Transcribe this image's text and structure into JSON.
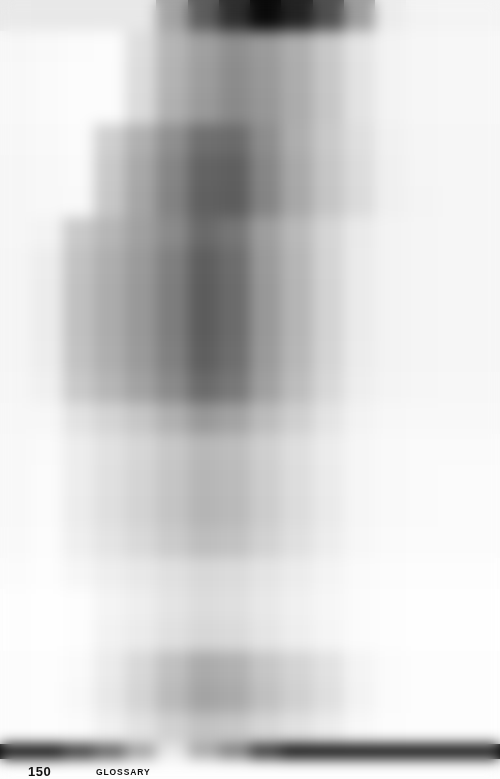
{
  "page": {
    "width": 500,
    "height": 779,
    "background": "#fdfdfd",
    "kind": "pixelated-book-page"
  },
  "footer": {
    "folio": "150",
    "running_head": "GLOSSARY"
  },
  "mosaic": {
    "columns": 16,
    "description": "Heavily pixelated grayscale mosaic of a scanned book page; a dark column of text runs down the centre with wide light margins left and right.",
    "row_heights": [
      31,
      31,
      31,
      31,
      31,
      31,
      31,
      31,
      31,
      31,
      31,
      31,
      31,
      31,
      31,
      31,
      31,
      31,
      31,
      31,
      31,
      31,
      31,
      31,
      15
    ],
    "palette": {
      "paper": "#fdfdfd",
      "ink": "#000000",
      "accent_dark": "#5a5a5a",
      "accent_mid": "#9a9a9a",
      "accent_light": "#e6e6e6"
    },
    "rows": [
      [
        "#e9e9e9",
        "#e8e8e8",
        "#e8e8e8",
        "#e8e8e8",
        "#e8e8e8",
        "#a3a3a3",
        "#5c5c5c",
        "#2e2e2e",
        "#0a0a0a",
        "#232323",
        "#4f4f4f",
        "#9e9e9e",
        "#ececec",
        "#f3f3f3",
        "#f4f4f4",
        "#f4f4f4"
      ],
      [
        "#f7f7f7",
        "#f9f9f9",
        "#fbfbfb",
        "#fcfcfc",
        "#dedede",
        "#b5b5b5",
        "#a0a0a0",
        "#8f8f8f",
        "#9b9b9b",
        "#aeaeae",
        "#c8c8c8",
        "#e4e4e4",
        "#f3f3f3",
        "#f6f6f6",
        "#f7f7f7",
        "#f7f7f7"
      ],
      [
        "#f8f8f8",
        "#fafafa",
        "#fcfcfc",
        "#fcfcfc",
        "#dcdcdc",
        "#b3b3b3",
        "#9d9d9d",
        "#8c8c8c",
        "#999999",
        "#adadad",
        "#c7c7c7",
        "#e3e3e3",
        "#f3f3f3",
        "#f6f6f6",
        "#f7f7f7",
        "#f7f7f7"
      ],
      [
        "#f8f8f8",
        "#fafafa",
        "#fcfcfc",
        "#fcfcfc",
        "#dbdbdb",
        "#b0b0b0",
        "#9a9a9a",
        "#8a8a8a",
        "#979797",
        "#acacac",
        "#c6c6c6",
        "#e3e3e3",
        "#f3f3f3",
        "#f6f6f6",
        "#f7f7f7",
        "#f7f7f7"
      ],
      [
        "#f7f7f7",
        "#f9f9f9",
        "#fbfbfb",
        "#cfcfcf",
        "#b0b0b0",
        "#8f8f8f",
        "#6f6f6f",
        "#6b6b6b",
        "#8d8d8d",
        "#aeaeae",
        "#c9c9c9",
        "#dfdfdf",
        "#f1f1f1",
        "#f5f5f5",
        "#f6f6f6",
        "#f6f6f6"
      ],
      [
        "#f6f6f6",
        "#f8f8f8",
        "#fafafa",
        "#c9c9c9",
        "#a8a8a8",
        "#858585",
        "#636363",
        "#5f5f5f",
        "#868686",
        "#a9a9a9",
        "#c6c6c6",
        "#dcdcdc",
        "#f0f0f0",
        "#f5f5f5",
        "#f6f6f6",
        "#f6f6f6"
      ],
      [
        "#f6f6f6",
        "#f8f8f8",
        "#f9f9f9",
        "#c7c7c7",
        "#a5a5a5",
        "#828282",
        "#606060",
        "#5d5d5d",
        "#848484",
        "#a8a8a8",
        "#c5c5c5",
        "#dbdbdb",
        "#f0f0f0",
        "#f4f4f4",
        "#f6f6f6",
        "#f6f6f6"
      ],
      [
        "#f6f6f6",
        "#f3f3f3",
        "#c9c9c9",
        "#b6b6b6",
        "#a0a0a0",
        "#8a8a8a",
        "#6a6a6a",
        "#767676",
        "#9e9e9e",
        "#b9b9b9",
        "#d5d5d5",
        "#eaeaea",
        "#f3f3f3",
        "#f5f5f5",
        "#f6f6f6",
        "#f6f6f6"
      ],
      [
        "#f5f5f5",
        "#ededed",
        "#c2c2c2",
        "#aeaeae",
        "#9a9a9a",
        "#7f7f7f",
        "#5e5e5e",
        "#6d6d6d",
        "#9a9a9a",
        "#b6b6b6",
        "#d4d4d4",
        "#ebebeb",
        "#f3f3f3",
        "#f5f5f5",
        "#f6f6f6",
        "#f6f6f6"
      ],
      [
        "#f5f5f5",
        "#ececec",
        "#c0c0c0",
        "#acacac",
        "#989898",
        "#7d7d7d",
        "#5c5c5c",
        "#6b6b6b",
        "#989898",
        "#b5b5b5",
        "#d3d3d3",
        "#ebebeb",
        "#f3f3f3",
        "#f5f5f5",
        "#f6f6f6",
        "#f6f6f6"
      ],
      [
        "#f5f5f5",
        "#ececec",
        "#c0c0c0",
        "#acacac",
        "#989898",
        "#7d7d7d",
        "#5c5c5c",
        "#6b6b6b",
        "#989898",
        "#b5b5b5",
        "#d3d3d3",
        "#ebebeb",
        "#f3f3f3",
        "#f5f5f5",
        "#f6f6f6",
        "#f6f6f6"
      ],
      [
        "#f5f5f5",
        "#ededed",
        "#c2c2c2",
        "#aeaeae",
        "#9a9a9a",
        "#808080",
        "#5f5f5f",
        "#6e6e6e",
        "#9a9a9a",
        "#b7b7b7",
        "#d4d4d4",
        "#ececec",
        "#f3f3f3",
        "#f5f5f5",
        "#f6f6f6",
        "#f6f6f6"
      ],
      [
        "#f6f6f6",
        "#f0f0f0",
        "#c9c9c9",
        "#b6b6b6",
        "#a2a2a2",
        "#8a8a8a",
        "#6b6b6b",
        "#787878",
        "#a0a0a0",
        "#bdbdbd",
        "#d8d8d8",
        "#eeeeee",
        "#f4f4f4",
        "#f6f6f6",
        "#f7f7f7",
        "#f7f7f7"
      ],
      [
        "#f7f7f7",
        "#f7f7f7",
        "#e2e2e2",
        "#d4d4d4",
        "#c6c6c6",
        "#b0b0b0",
        "#999999",
        "#a3a3a3",
        "#bcbcbc",
        "#cfcfcf",
        "#e4e4e4",
        "#f3f3f3",
        "#f7f7f7",
        "#f8f8f8",
        "#f8f8f8",
        "#f8f8f8"
      ],
      [
        "#f8f8f8",
        "#fafafa",
        "#ededed",
        "#e1e1e1",
        "#d6d6d6",
        "#c7c7c7",
        "#b8b8b8",
        "#bdbdbd",
        "#cfcfcf",
        "#dedede",
        "#ececec",
        "#f6f6f6",
        "#f9f9f9",
        "#fafafa",
        "#fafafa",
        "#fafafa"
      ],
      [
        "#f8f8f8",
        "#fbfbfb",
        "#ededed",
        "#e0e0e0",
        "#d4d4d4",
        "#c5c5c5",
        "#b6b6b6",
        "#bbbbbb",
        "#cdcdcd",
        "#dddddd",
        "#ebebeb",
        "#f6f6f6",
        "#f9f9f9",
        "#fafafa",
        "#fbfbfb",
        "#fbfbfb"
      ],
      [
        "#f8f8f8",
        "#fbfbfb",
        "#ececec",
        "#dfdfdf",
        "#d3d3d3",
        "#c4c4c4",
        "#b5b5b5",
        "#babab a",
        "#cccccc",
        "#dcdcdc",
        "#eaeaea",
        "#f6f6f6",
        "#f9f9f9",
        "#fafafa",
        "#fbfbfb",
        "#fbfbfb"
      ],
      [
        "#f9f9f9",
        "#fcfcfc",
        "#efefef",
        "#e4e4e4",
        "#d9d9d9",
        "#cbcbcb",
        "#bebebe",
        "#c2c2c2",
        "#d2d2d2",
        "#e0e0e0",
        "#ededed",
        "#f7f7f7",
        "#fafafa",
        "#fbfbfb",
        "#fbfbfb",
        "#fbfbfb"
      ],
      [
        "#fbfbfb",
        "#fdfdfd",
        "#f6f6f6",
        "#eeeeee",
        "#e8e8e8",
        "#e0e0e0",
        "#d8d8d8",
        "#dbdbdb",
        "#e4e4e4",
        "#ececec",
        "#f4f4f4",
        "#fafafa",
        "#fcfcfc",
        "#fdfdfd",
        "#fdfdfd",
        "#fdfdfd"
      ],
      [
        "#fdfdfd",
        "#fefefe",
        "#fdfdfd",
        "#f4f4f4",
        "#eeeeee",
        "#e4e4e4",
        "#dcdcdc",
        "#dfdfdf",
        "#e8e8e8",
        "#f0f0f0",
        "#f6f6f6",
        "#fbfbfb",
        "#fdfdfd",
        "#fefefe",
        "#fefefe",
        "#fefefe"
      ],
      [
        "#fdfdfd",
        "#fefefe",
        "#fdfdfd",
        "#f2f2f2",
        "#ebebeb",
        "#e0e0e0",
        "#d7d7d7",
        "#dadada",
        "#e5e5e5",
        "#eeeeee",
        "#f5f5f5",
        "#fbfbfb",
        "#fdfdfd",
        "#fefefe",
        "#fefefe",
        "#fefefe"
      ],
      [
        "#fcfcfc",
        "#fdfdfd",
        "#fafafa",
        "#ebebeb",
        "#d8d8d8",
        "#c0c0c0",
        "#ababab",
        "#b1b1b1",
        "#c6c6c6",
        "#d4d4d4",
        "#e2e2e2",
        "#f4f4f4",
        "#fbfbfb",
        "#fdfdfd",
        "#fdfdfd",
        "#fdfdfd"
      ],
      [
        "#fcfcfc",
        "#fdfdfd",
        "#f8f8f8",
        "#e8e8e8",
        "#d4d4d4",
        "#bababa",
        "#a4a4a4",
        "#aaaaaa",
        "#c0c0c0",
        "#d0d0d0",
        "#dfdfdf",
        "#f3f3f3",
        "#fbfbfb",
        "#fdfdfd",
        "#fdfdfd",
        "#fdfdfd"
      ],
      [
        "#fcfcfc",
        "#fdfdfd",
        "#fbfbfb",
        "#f0f0f0",
        "#e2e2e2",
        "#d1d1d1",
        "#c2c2c2",
        "#c7c7c7",
        "#d6d6d6",
        "#e1e1e1",
        "#ececec",
        "#f8f8f8",
        "#fcfcfc",
        "#fdfdfd",
        "#fdfdfd",
        "#fdfdfd"
      ],
      [
        "#000000",
        "#000000",
        "#2b2b2b",
        "#555555",
        "#9d9d9d",
        "#e8e8e8",
        "#a6a6a6",
        "#7a7a7a",
        "#2a2a2a",
        "#000000",
        "#000000",
        "#000000",
        "#000000",
        "#000000",
        "#000000",
        "#000000"
      ]
    ]
  }
}
